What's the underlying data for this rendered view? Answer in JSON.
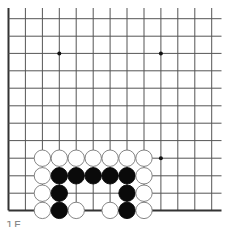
{
  "board": {
    "description": "Go board fragment (lower-left region)",
    "grid_x": [
      8.5,
      25.4,
      42.4,
      59.3,
      76.2,
      93.2,
      110.1,
      127.0,
      144.0,
      160.9,
      177.8,
      194.8,
      211.7
    ],
    "grid_y": [
      18.7,
      36.2,
      53.4,
      70.8,
      88.2,
      105.8,
      123.2,
      140.6,
      158.2,
      175.8,
      193.2,
      210.4
    ],
    "line_x_end": 221.5,
    "line_y_start": 8,
    "edges": {
      "left": true,
      "bottom": true,
      "top": false,
      "right": false
    },
    "line_color": "#555555",
    "edge_color": "#333333",
    "star_points": [
      [
        3,
        2
      ],
      [
        9,
        2
      ],
      [
        9,
        8
      ]
    ],
    "stone_radius": 8.2,
    "stones": [
      {
        "color": "white",
        "col": 2,
        "row": 8
      },
      {
        "color": "white",
        "col": 3,
        "row": 8
      },
      {
        "color": "white",
        "col": 4,
        "row": 8
      },
      {
        "color": "white",
        "col": 5,
        "row": 8
      },
      {
        "color": "white",
        "col": 6,
        "row": 8
      },
      {
        "color": "white",
        "col": 7,
        "row": 8
      },
      {
        "color": "white",
        "col": 8,
        "row": 8
      },
      {
        "color": "white",
        "col": 2,
        "row": 9
      },
      {
        "color": "black",
        "col": 3,
        "row": 9
      },
      {
        "color": "black",
        "col": 4,
        "row": 9
      },
      {
        "color": "black",
        "col": 5,
        "row": 9
      },
      {
        "color": "black",
        "col": 6,
        "row": 9
      },
      {
        "color": "black",
        "col": 7,
        "row": 9
      },
      {
        "color": "white",
        "col": 8,
        "row": 9
      },
      {
        "color": "white",
        "col": 2,
        "row": 10
      },
      {
        "color": "black",
        "col": 3,
        "row": 10
      },
      {
        "color": "black",
        "col": 7,
        "row": 10
      },
      {
        "color": "white",
        "col": 8,
        "row": 10
      },
      {
        "color": "white",
        "col": 2,
        "row": 11
      },
      {
        "color": "black",
        "col": 3,
        "row": 11
      },
      {
        "color": "white",
        "col": 4,
        "row": 11
      },
      {
        "color": "white",
        "col": 6,
        "row": 11
      },
      {
        "color": "black",
        "col": 7,
        "row": 11
      },
      {
        "color": "white",
        "col": 8,
        "row": 11
      }
    ]
  },
  "caption": "1E"
}
